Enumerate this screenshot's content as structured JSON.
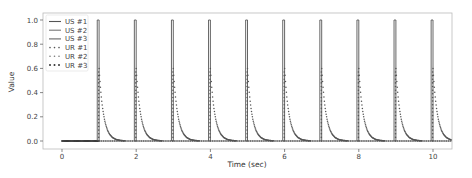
{
  "chart_data": {
    "type": "line",
    "title": "",
    "xlabel": "Time (sec)",
    "ylabel": "Value",
    "xlim": [
      -0.5,
      10.5
    ],
    "ylim": [
      -0.05,
      1.05
    ],
    "xticks": [
      0,
      2,
      4,
      6,
      8,
      10
    ],
    "yticks": [
      0.0,
      0.2,
      0.4,
      0.6,
      0.8,
      1.0
    ],
    "ytick_labels": [
      "0.0",
      "0.2",
      "0.4",
      "0.6",
      "0.8",
      "1.0"
    ],
    "grid": false,
    "legend_position": "upper left",
    "pulse_times": [
      1,
      2,
      3,
      4,
      5,
      6,
      7,
      8,
      9,
      10
    ],
    "pulse_width": 0.05,
    "pulse_height": 1.0,
    "decay_peak": 0.6,
    "decay_tau": 0.12,
    "series": [
      {
        "name": "US #1",
        "style": "solid",
        "color": "#555555",
        "description": "rectangular pulses of height 1.0 at t=1..10"
      },
      {
        "name": "US #2",
        "style": "solid",
        "color": "#777777",
        "description": "near zero baseline"
      },
      {
        "name": "US #3",
        "style": "solid",
        "color": "#666666",
        "description": "near zero baseline"
      },
      {
        "name": "UR #1",
        "style": "dotted",
        "color": "#555555",
        "description": "exponential decay from ~0.6 after each pulse"
      },
      {
        "name": "UR #2",
        "style": "dotted",
        "color": "#777777",
        "description": "near zero baseline"
      },
      {
        "name": "UR #3",
        "style": "dotted",
        "color": "#333333",
        "description": "near zero baseline"
      }
    ]
  },
  "legend": {
    "items": [
      {
        "label": "US #1",
        "style": "solid",
        "color": "#555555"
      },
      {
        "label": "US #2",
        "style": "solid",
        "color": "#777777"
      },
      {
        "label": "US #3",
        "style": "solid",
        "color": "#666666"
      },
      {
        "label": "UR #1",
        "style": "dotted",
        "color": "#555555"
      },
      {
        "label": "UR #2",
        "style": "dotted",
        "color": "#777777"
      },
      {
        "label": "UR #3",
        "style": "dotted",
        "color": "#333333"
      }
    ]
  }
}
